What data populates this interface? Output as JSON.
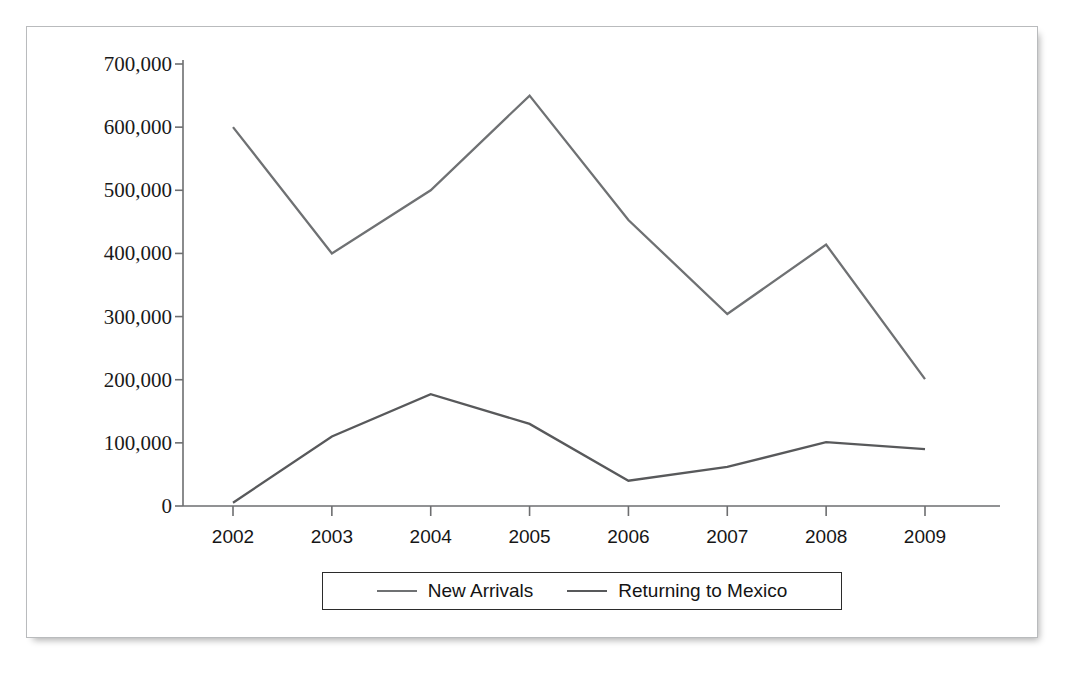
{
  "chart_data": {
    "type": "line",
    "title": "",
    "xlabel": "",
    "ylabel": "",
    "categories": [
      "2002",
      "2003",
      "2004",
      "2005",
      "2006",
      "2007",
      "2008",
      "2009"
    ],
    "ylim": [
      0,
      700000
    ],
    "yticks": [
      0,
      100000,
      200000,
      300000,
      400000,
      500000,
      600000,
      700000
    ],
    "ytick_labels": [
      "0",
      "100,000",
      "200,000",
      "300,000",
      "400,000",
      "500,000",
      "600,000",
      "700,000"
    ],
    "grid": false,
    "legend_position": "bottom-center",
    "series": [
      {
        "name": "New Arrivals",
        "color": "#6f7173",
        "values": [
          600000,
          400000,
          500000,
          650000,
          453000,
          304000,
          414000,
          201000
        ]
      },
      {
        "name": "Returning to Mexico",
        "color": "#58595b",
        "values": [
          5000,
          110000,
          177000,
          130000,
          40000,
          62000,
          101000,
          90000
        ]
      }
    ]
  },
  "figure": {
    "frame_border_color": "#b9bbbd",
    "axis_color": "#6d6e70",
    "background_color": "#ffffff"
  },
  "legend": {
    "entries": [
      {
        "label": "New Arrivals",
        "color": "#6f7173"
      },
      {
        "label": "Returning to Mexico",
        "color": "#58595b"
      }
    ]
  }
}
